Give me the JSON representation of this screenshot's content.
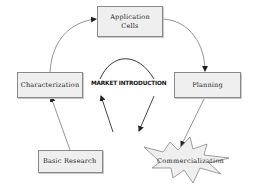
{
  "diagram": {
    "nodes": {
      "application_cells": {
        "line1": "Application",
        "line2": "Cells"
      },
      "characterization": {
        "label": "Characterization"
      },
      "planning": {
        "label": "Planning"
      },
      "basic_research": {
        "label": "Basic Research"
      },
      "commercialization": {
        "label": "Commercialization"
      }
    },
    "center_label": "MARKET INTRODUCTION",
    "edges": [
      {
        "from": "characterization",
        "to": "application_cells",
        "style": "curved-arrow"
      },
      {
        "from": "application_cells",
        "to": "planning",
        "style": "curved-arrow"
      },
      {
        "from": "basic_research",
        "to": "characterization",
        "style": "arrow"
      },
      {
        "from": "planning",
        "to": "commercialization",
        "style": "arrow"
      },
      {
        "from": "center",
        "to": "market_introduction",
        "style": "arrow"
      },
      {
        "from": "market_introduction",
        "to": "center",
        "style": "arrow"
      }
    ],
    "colors": {
      "box_fill": "#efefef",
      "box_border": "#8a8a8a",
      "line": "#555555",
      "star_fill": "#eeeeee"
    }
  }
}
